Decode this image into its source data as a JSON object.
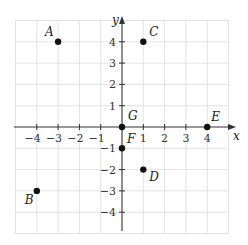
{
  "diagram": {
    "type": "coordinate-plane",
    "x_axis_label": "x",
    "y_axis_label": "y",
    "x_range": [
      -5,
      5
    ],
    "y_range": [
      -5,
      5
    ],
    "x_tick_labels": [
      "−4",
      "−3",
      "−2",
      "−1",
      "1",
      "2",
      "3",
      "4"
    ],
    "y_tick_labels": [
      "4",
      "3",
      "2",
      "1",
      "−1",
      "−2",
      "−3",
      "−4"
    ],
    "grid": true,
    "colors": {
      "grid": "#dcdcdc",
      "axis": "#333333",
      "point": "#111111"
    }
  },
  "points": [
    {
      "label": "A",
      "x": -3,
      "y": 4
    },
    {
      "label": "B",
      "x": -4,
      "y": -3
    },
    {
      "label": "C",
      "x": 1,
      "y": 4
    },
    {
      "label": "D",
      "x": 1,
      "y": -2
    },
    {
      "label": "E",
      "x": 4,
      "y": 0
    },
    {
      "label": "F",
      "x": 0,
      "y": -1
    },
    {
      "label": "G",
      "x": 0,
      "y": 0
    }
  ]
}
